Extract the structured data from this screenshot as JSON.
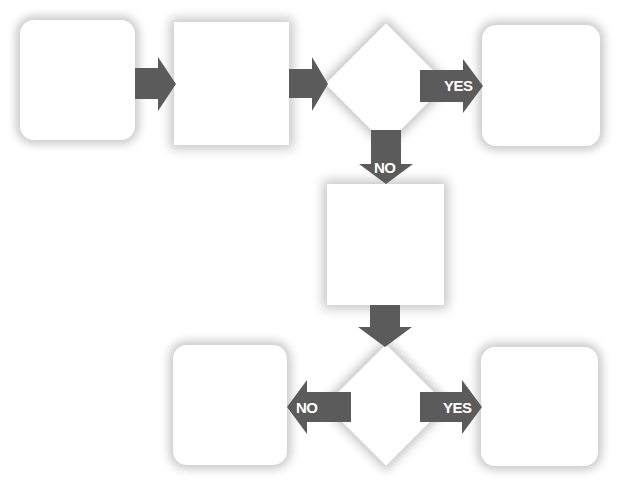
{
  "diagram": {
    "type": "flowchart",
    "colors": {
      "arrow": "#5b5b5b",
      "node_fill": "#ffffff",
      "label_text": "#ffffff"
    },
    "nodes": [
      {
        "id": "box-1",
        "shape": "rounded-rect",
        "text": ""
      },
      {
        "id": "box-2",
        "shape": "rect",
        "text": ""
      },
      {
        "id": "decision-1",
        "shape": "diamond",
        "text": ""
      },
      {
        "id": "box-yes-1",
        "shape": "rounded-rect",
        "text": ""
      },
      {
        "id": "box-no-1",
        "shape": "rect",
        "text": ""
      },
      {
        "id": "decision-2",
        "shape": "diamond",
        "text": ""
      },
      {
        "id": "box-no-2",
        "shape": "rounded-rect",
        "text": ""
      },
      {
        "id": "box-yes-2",
        "shape": "rounded-rect",
        "text": ""
      }
    ],
    "edges": [
      {
        "from": "box-1",
        "to": "box-2",
        "label": ""
      },
      {
        "from": "box-2",
        "to": "decision-1",
        "label": ""
      },
      {
        "from": "decision-1",
        "to": "box-yes-1",
        "label": "YES"
      },
      {
        "from": "decision-1",
        "to": "box-no-1",
        "label": "NO"
      },
      {
        "from": "box-no-1",
        "to": "decision-2",
        "label": ""
      },
      {
        "from": "decision-2",
        "to": "box-no-2",
        "label": "NO"
      },
      {
        "from": "decision-2",
        "to": "box-yes-2",
        "label": "YES"
      }
    ]
  }
}
